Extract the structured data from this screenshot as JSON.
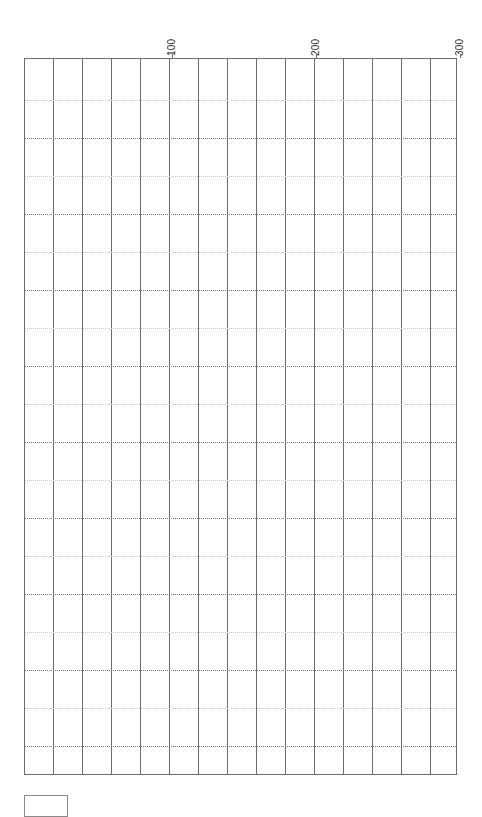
{
  "chart_data": {
    "type": "table",
    "title": "",
    "subtitle": "",
    "xlabel": "",
    "ylabel": "",
    "description": "Empty grid plot area with no plotted data series; only axis tick labels and grid lines are rendered.",
    "grid": true,
    "grid_style": {
      "vertical": "solid",
      "horizontal": "dotted",
      "major_minor_alternating": true
    },
    "legend": {
      "position": "bottom-left",
      "entries": []
    },
    "axis": {
      "position": "top",
      "orientation": "horizontal",
      "label_rotation_deg": -90,
      "xlim": [
        0,
        322
      ],
      "tick_labels": [
        "100",
        "200",
        "300"
      ],
      "tick_values": [
        100,
        200,
        300
      ],
      "tick_x_px": [
        172,
        316,
        460
      ]
    },
    "columns": {
      "count": 15,
      "boundary_x_px": [
        24,
        53,
        82,
        111,
        140,
        169,
        198,
        227,
        256,
        285,
        314,
        343,
        372,
        401,
        430,
        457
      ]
    },
    "rows": {
      "count": 19,
      "line_y_px": [
        100,
        138,
        176,
        214,
        252,
        290,
        328,
        366,
        404,
        442,
        480,
        518,
        556,
        594,
        632,
        670,
        708,
        746
      ],
      "major_indices": [
        1,
        3,
        5,
        7,
        9,
        11,
        13,
        15,
        17
      ]
    },
    "series": [],
    "categories": [],
    "values": [],
    "colors": {
      "background": "#ffffff",
      "frame": "#6d6d6d",
      "gridline_major": "#7a7a7a",
      "gridline_minor": "#c9c9c9",
      "label_text": "#2b2b2b",
      "legend_border": "#8a8a8a"
    }
  },
  "plot": {
    "frame_label": "plot-area",
    "empty_state": ""
  },
  "legend": {
    "box_label": ""
  }
}
